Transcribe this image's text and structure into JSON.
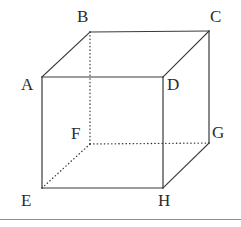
{
  "figure": {
    "type": "geometric-solid",
    "shape": "cube",
    "stroke_color": "#3a3a3a",
    "dotted_color": "#3a3a3a",
    "label_color": "#2b2b2b",
    "background_color": "#ffffff",
    "rule_color": "#8f8f8f",
    "canvas": {
      "width": 241,
      "height": 227
    }
  },
  "vertices": [
    {
      "id": "A",
      "label": "A",
      "x": 42,
      "y": 77,
      "label_x": 21,
      "label_y": 76,
      "face": "front"
    },
    {
      "id": "B",
      "label": "B",
      "x": 90,
      "y": 32,
      "label_x": 77,
      "label_y": 8,
      "face": "back"
    },
    {
      "id": "C",
      "label": "C",
      "x": 209,
      "y": 31,
      "label_x": 210,
      "label_y": 8,
      "face": "back"
    },
    {
      "id": "D",
      "label": "D",
      "x": 163,
      "y": 77,
      "label_x": 167,
      "label_y": 76,
      "face": "front"
    },
    {
      "id": "E",
      "label": "E",
      "x": 42,
      "y": 188,
      "label_x": 21,
      "label_y": 192,
      "face": "front"
    },
    {
      "id": "F",
      "label": "F",
      "x": 90,
      "y": 144,
      "label_x": 71,
      "label_y": 125,
      "face": "back"
    },
    {
      "id": "G",
      "label": "G",
      "x": 209,
      "y": 143,
      "label_x": 212,
      "label_y": 124,
      "face": "back"
    },
    {
      "id": "H",
      "label": "H",
      "x": 163,
      "y": 188,
      "label_x": 158,
      "label_y": 192,
      "face": "front"
    }
  ],
  "edges": [
    {
      "id": "AB",
      "from": "A",
      "to": "B",
      "style": "solid"
    },
    {
      "id": "BC",
      "from": "B",
      "to": "C",
      "style": "solid"
    },
    {
      "id": "CD",
      "from": "C",
      "to": "D",
      "style": "solid"
    },
    {
      "id": "DA",
      "from": "D",
      "to": "A",
      "style": "solid"
    },
    {
      "id": "AE",
      "from": "A",
      "to": "E",
      "style": "solid"
    },
    {
      "id": "DH",
      "from": "D",
      "to": "H",
      "style": "solid"
    },
    {
      "id": "EH",
      "from": "E",
      "to": "H",
      "style": "solid"
    },
    {
      "id": "CG",
      "from": "C",
      "to": "G",
      "style": "solid"
    },
    {
      "id": "GH",
      "from": "G",
      "to": "H",
      "style": "solid"
    },
    {
      "id": "BF",
      "from": "B",
      "to": "F",
      "style": "dotted"
    },
    {
      "id": "FG",
      "from": "F",
      "to": "G",
      "style": "dotted"
    },
    {
      "id": "FE",
      "from": "F",
      "to": "E",
      "style": "dotted"
    }
  ],
  "rule": {
    "y": 219
  }
}
